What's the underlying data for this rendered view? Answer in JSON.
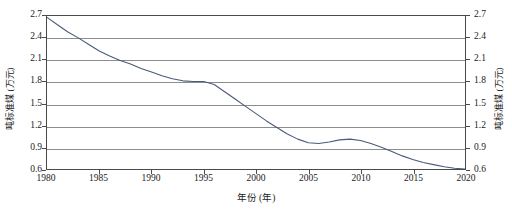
{
  "chart_data": {
    "type": "line",
    "title": "",
    "xlabel": "年份 (年)",
    "ylabel": "吨标准煤 (万元)",
    "ylabel_right": "吨标准煤 (万元)",
    "grid": "horizontal",
    "legend": "none",
    "xlim": [
      1980,
      2020
    ],
    "ylim": [
      0.6,
      2.7
    ],
    "ytick_step": 0.3,
    "xtick_step": 5,
    "xticks": [
      "1980",
      "1985",
      "1990",
      "1995",
      "2000",
      "2005",
      "2010",
      "2015",
      "2020"
    ],
    "yticks": [
      "0.6",
      "0.9",
      "1.2",
      "1.5",
      "1.8",
      "2.1",
      "2.4",
      "2.7"
    ],
    "line_color": "#4a5a7a",
    "grid_color": "#8d8d8d",
    "axis_color": "#4a4a4a",
    "series": [
      {
        "name": "单位GDP能耗",
        "x": [
          1980,
          1981,
          1982,
          1983,
          1984,
          1985,
          1986,
          1987,
          1988,
          1989,
          1990,
          1991,
          1992,
          1993,
          1994,
          1995,
          1996,
          1997,
          1998,
          1999,
          2000,
          2001,
          2002,
          2003,
          2004,
          2005,
          2006,
          2007,
          2008,
          2009,
          2010,
          2011,
          2012,
          2013,
          2014,
          2015,
          2016,
          2017,
          2018,
          2019,
          2020
        ],
        "values": [
          2.68,
          2.58,
          2.48,
          2.4,
          2.31,
          2.22,
          2.15,
          2.09,
          2.04,
          1.98,
          1.93,
          1.88,
          1.84,
          1.81,
          1.8,
          1.8,
          1.76,
          1.66,
          1.56,
          1.46,
          1.36,
          1.26,
          1.17,
          1.08,
          1.01,
          0.96,
          0.95,
          0.97,
          1.0,
          1.01,
          0.99,
          0.95,
          0.9,
          0.84,
          0.78,
          0.73,
          0.69,
          0.66,
          0.63,
          0.61,
          0.6
        ]
      }
    ]
  }
}
